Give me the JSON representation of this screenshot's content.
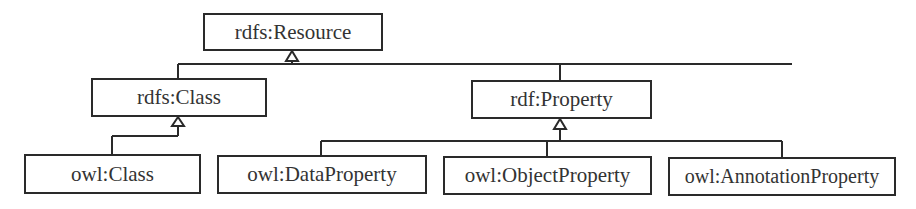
{
  "diagram": {
    "type": "class-hierarchy",
    "nodes": {
      "resource": {
        "label": "rdfs:Resource"
      },
      "rdfs_class": {
        "label": "rdfs:Class"
      },
      "rdf_property": {
        "label": "rdf:Property"
      },
      "owl_class": {
        "label": "owl:Class"
      },
      "owl_data_property": {
        "label": "owl:DataProperty"
      },
      "owl_object_property": {
        "label": "owl:ObjectProperty"
      },
      "owl_annotation_property": {
        "label": "owl:AnnotationProperty"
      }
    },
    "edges": [
      {
        "from": "rdfs:Class",
        "to": "rdfs:Resource",
        "type": "generalization"
      },
      {
        "from": "rdf:Property",
        "to": "rdfs:Resource",
        "type": "generalization"
      },
      {
        "from": "owl:Class",
        "to": "rdfs:Class",
        "type": "generalization"
      },
      {
        "from": "owl:DataProperty",
        "to": "rdf:Property",
        "type": "generalization"
      },
      {
        "from": "owl:ObjectProperty",
        "to": "rdf:Property",
        "type": "generalization"
      },
      {
        "from": "owl:AnnotationProperty",
        "to": "rdf:Property",
        "type": "generalization"
      }
    ],
    "colors": {
      "line": "#2a2a2a",
      "text": "#333333",
      "background": "#ffffff"
    }
  }
}
